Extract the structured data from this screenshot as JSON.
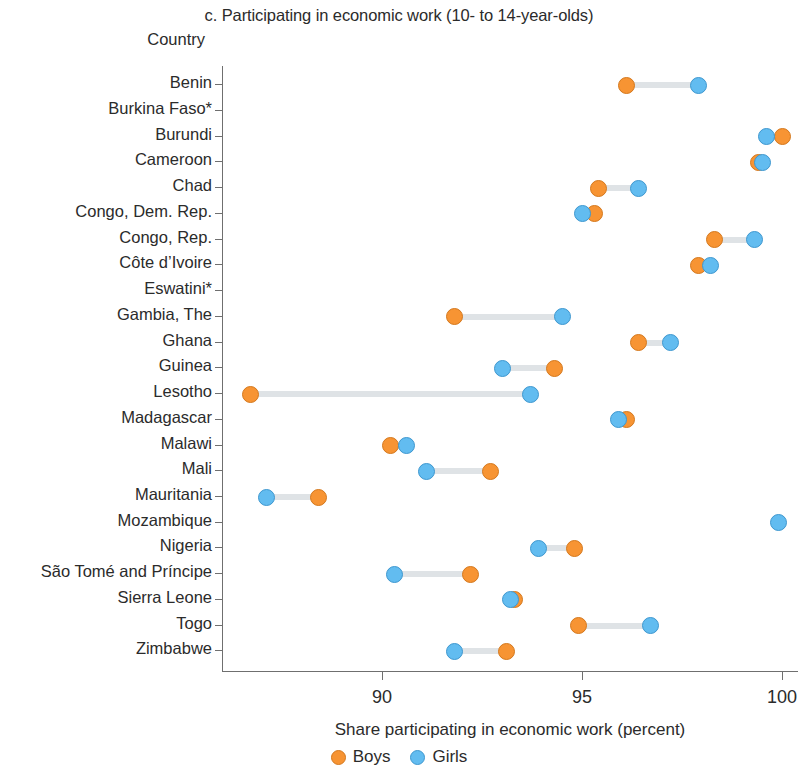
{
  "chart_data": {
    "type": "scatter",
    "title": "c. Participating in economic work (10- to 14-year-olds)",
    "category_axis_label": "Country",
    "xlabel": "Share participating in economic work (percent)",
    "ylabel": "Country",
    "xlim": [
      86.0,
      100.4
    ],
    "xticks": [
      90,
      95,
      100
    ],
    "xticklabels": [
      "90",
      "95",
      "100"
    ],
    "grid": false,
    "legend_position": "bottom",
    "legend": [
      {
        "name": "Boys",
        "color": "#f79433"
      },
      {
        "name": "Girls",
        "color": "#62bcf0"
      }
    ],
    "categories": [
      "Benin",
      "Burkina Faso*",
      "Burundi",
      "Cameroon",
      "Chad",
      "Congo, Dem. Rep.",
      "Congo, Rep.",
      "Côte d’Ivoire",
      "Eswatini*",
      "Gambia, The",
      "Ghana",
      "Guinea",
      "Lesotho",
      "Madagascar",
      "Malawi",
      "Mali",
      "Mauritania",
      "Mozambique",
      "Nigeria",
      "São Tomé and Príncipe",
      "Sierra Leone",
      "Togo",
      "Zimbabwe"
    ],
    "series": [
      {
        "name": "Boys",
        "color": "#f79433",
        "values": [
          96.1,
          null,
          100.0,
          99.4,
          95.4,
          95.3,
          98.3,
          97.9,
          null,
          91.8,
          96.4,
          94.3,
          86.7,
          96.1,
          90.2,
          92.7,
          88.4,
          null,
          94.8,
          92.2,
          93.3,
          94.9,
          93.1
        ]
      },
      {
        "name": "Girls",
        "color": "#62bcf0",
        "values": [
          97.9,
          null,
          99.6,
          99.5,
          96.4,
          95.0,
          99.3,
          98.2,
          null,
          94.5,
          97.2,
          93.0,
          93.7,
          95.9,
          90.6,
          91.1,
          87.1,
          99.9,
          93.9,
          90.3,
          93.2,
          96.7,
          91.8
        ]
      }
    ]
  }
}
